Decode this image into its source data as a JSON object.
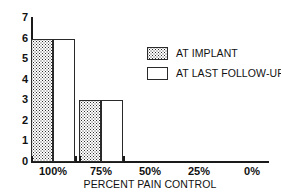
{
  "chart_data": {
    "type": "bar",
    "title": "",
    "subtitle": "",
    "xlabel": "PERCENT PAIN CONTROL",
    "ylabel": "",
    "categories": [
      "100%",
      "75%",
      "50%",
      "25%",
      "0%"
    ],
    "series": [
      {
        "name": "AT IMPLANT",
        "fill": "stipple",
        "values": [
          6,
          3,
          0,
          0,
          0
        ]
      },
      {
        "name": "AT LAST FOLLOW-UP",
        "fill": "empty",
        "values": [
          6,
          3,
          0,
          0,
          0
        ]
      }
    ],
    "ylim": [
      0,
      7
    ],
    "yticks": [
      0,
      1,
      2,
      3,
      4,
      5,
      6,
      7
    ],
    "ytick_labels": [
      "0",
      "1",
      "2",
      "3",
      "4",
      "5",
      "6",
      "7"
    ],
    "grid": false,
    "legend_position": "upper-right",
    "axis_color": "#1a1a1a",
    "bar_edge_color": "#2a2a2a",
    "bar_fill_color": "#ffffff",
    "stipple_color": "#2f2f2f",
    "background": "#ffffff"
  }
}
